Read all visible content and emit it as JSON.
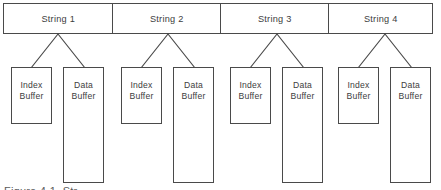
{
  "figure": {
    "background_color": "#ffffff",
    "line_color": "#4a4a4a",
    "text_color": "#3d3d3d",
    "caption": "Figure 4-1.  Str",
    "strings": [
      {
        "label": "String 1"
      },
      {
        "label": "String 2"
      },
      {
        "label": "String 3"
      },
      {
        "label": "String 4"
      }
    ],
    "buffers": [
      {
        "label": "Index\nBuffer"
      },
      {
        "label": "Data\nBuffer"
      },
      {
        "label": "Index\nBuffer"
      },
      {
        "label": "Data\nBuffer"
      },
      {
        "label": "Index\nBuffer"
      },
      {
        "label": "Data\nBuffer"
      },
      {
        "label": "Index\nBuffer"
      },
      {
        "label": "Data\nBuffer"
      }
    ]
  }
}
